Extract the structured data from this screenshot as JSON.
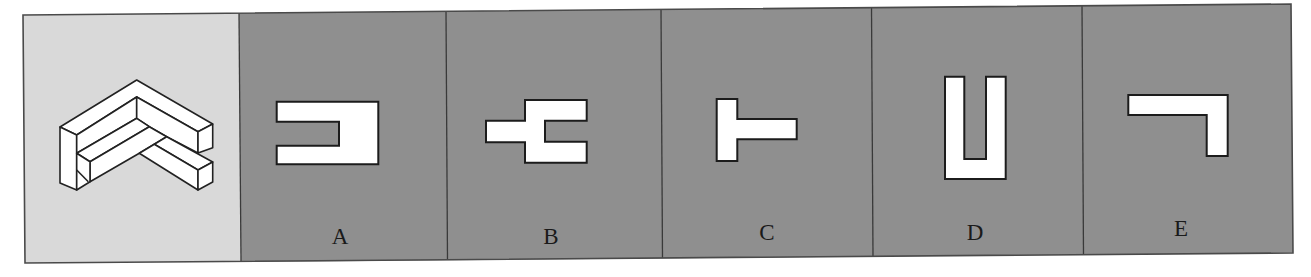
{
  "puzzle": {
    "type": "3d-figure-to-2d-view",
    "question_panel": {
      "background": "#d9d9d9",
      "figure": "isometric-L-shaped-stepped-block"
    },
    "options_background": "#8f8f8f",
    "options": [
      {
        "label": "A",
        "shape": "rectangle-with-left-slot"
      },
      {
        "label": "B",
        "shape": "rectangle-with-right-slot-and-left-nub"
      },
      {
        "label": "C",
        "shape": "T-rotated-left"
      },
      {
        "label": "D",
        "shape": "U-shape-open-top"
      },
      {
        "label": "E",
        "shape": "L-rotated-hook-down-right"
      }
    ],
    "colors": {
      "frame": "#4a4a4a",
      "divider": "#3a3a3a",
      "shape_fill": "#ffffff",
      "shape_stroke": "#1c1c1c"
    }
  }
}
